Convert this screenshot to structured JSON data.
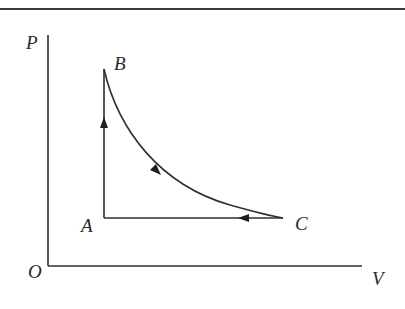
{
  "diagram": {
    "type": "P-V cycle diagram",
    "axes": {
      "y_label": "P",
      "x_label": "V",
      "origin_label": "O"
    },
    "points": {
      "A": {
        "label": "A"
      },
      "B": {
        "label": "B"
      },
      "C": {
        "label": "C"
      }
    },
    "processes": [
      {
        "from": "A",
        "to": "B",
        "shape": "vertical line (isochoric)",
        "direction": "up"
      },
      {
        "from": "B",
        "to": "C",
        "shape": "curve (hyperbola-like)",
        "direction": "down-right"
      },
      {
        "from": "C",
        "to": "A",
        "shape": "horizontal line (isobaric)",
        "direction": "left"
      }
    ],
    "colors": {
      "ink": "#2f2f2f",
      "background": "#ffffff"
    }
  }
}
